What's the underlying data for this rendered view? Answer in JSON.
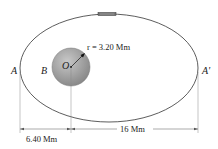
{
  "diagram": {
    "labels": {
      "A": "A",
      "A_prime": "A'",
      "B": "B",
      "O": "O",
      "radius": "r = 3.20 Mm",
      "dim_left": "6.40 Mm",
      "dim_right": "16 Mm"
    },
    "colors": {
      "orbit": "#333333",
      "planet_light": "#c4c4c4",
      "planet_dark": "#8a8a8a",
      "dimension": "#555555",
      "satellite": "#666666"
    }
  }
}
